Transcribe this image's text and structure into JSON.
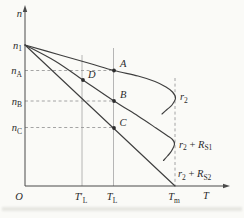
{
  "figure": {
    "background": "#fafaf7",
    "ink": "#3e3e3e",
    "guide_color": "#a3a3a3",
    "dash_color": "#9a9a9a",
    "text_color": "#2b2b2b"
  },
  "chart_data": {
    "type": "line",
    "title": "",
    "xlabel": "T",
    "ylabel": "n",
    "grid": false,
    "legend_position": "right-of-curves",
    "description_units": "pixel coordinates of 244x218 canvas; origin O at (25,186), y-axis up",
    "x_tick_labels": [
      "O",
      "T′L",
      "TL",
      "Tm"
    ],
    "y_tick_labels": [
      "n1",
      "nA",
      "nB",
      "nC"
    ],
    "series": [
      {
        "name": "natural-characteristic",
        "label": "r2",
        "points": [
          [
            25,
            45
          ],
          [
            60,
            55
          ],
          [
            90,
            63.5
          ],
          [
            114,
            70.5
          ],
          [
            138,
            76
          ],
          [
            155,
            81.5
          ],
          [
            166,
            87
          ],
          [
            172.5,
            92
          ],
          [
            175.5,
            98
          ],
          [
            172,
            105
          ],
          [
            167,
            109.5
          ],
          [
            162,
            114
          ]
        ]
      },
      {
        "name": "characteristic-with-RS1",
        "label": "r2 + RS1",
        "points": [
          [
            25,
            45
          ],
          [
            55,
            61
          ],
          [
            83,
            80
          ],
          [
            114,
            101
          ],
          [
            138,
            116
          ],
          [
            156,
            128
          ],
          [
            167,
            135.5
          ],
          [
            172.5,
            139.5
          ],
          [
            174.5,
            144
          ],
          [
            171.5,
            151
          ],
          [
            167.5,
            156
          ],
          [
            163.5,
            160.5
          ]
        ]
      },
      {
        "name": "characteristic-with-RS2",
        "label": "r2 + RS2",
        "points": [
          [
            25,
            45
          ],
          [
            175,
            186
          ]
        ]
      }
    ],
    "marked_points": [
      {
        "label": "A",
        "x": 114,
        "y": 70.5,
        "on": "natural-characteristic at TL"
      },
      {
        "label": "D",
        "x": 83,
        "y": 80,
        "on": "characteristic-with-RS1 at T′L"
      },
      {
        "label": "B",
        "x": 114,
        "y": 101,
        "on": "characteristic-with-RS1 at TL"
      },
      {
        "label": "C",
        "x": 114,
        "y": 128,
        "on": "characteristic-with-RS2 at TL"
      }
    ],
    "axes": {
      "y_axis": {
        "x": 25,
        "y_bottom": 186,
        "y_top": 9,
        "arrow_tip_y": 5
      },
      "x_axis": {
        "y": 186,
        "x_left": 25,
        "x_right": 225,
        "arrow_tip_x": 230
      }
    },
    "guide_lines": {
      "vertical_solid": [
        {
          "name": "TL-prime-guide",
          "x": 82,
          "y1": 55,
          "y2": 186
        },
        {
          "name": "TL-guide",
          "x": 113.5,
          "y1": 48,
          "y2": 186
        }
      ],
      "vertical_dashed": [
        {
          "name": "Tm-guide",
          "x": 175,
          "y1": 78,
          "y2": 186
        }
      ],
      "horizontal_dashed": [
        {
          "name": "nA-guide",
          "y": 70.5,
          "x1": 25,
          "x2": 114
        },
        {
          "name": "nB-guide",
          "y": 101,
          "x1": 25,
          "x2": 114
        },
        {
          "name": "nC-guide",
          "y": 127.5,
          "x1": 25,
          "x2": 114
        }
      ]
    },
    "labels": [
      {
        "name": "y-axis-label",
        "x": 22,
        "y": 17,
        "anchor": "end",
        "parts": [
          {
            "t": "n",
            "it": true
          }
        ]
      },
      {
        "name": "n1-tick-label",
        "x": 22,
        "y": 48.5,
        "anchor": "end",
        "parts": [
          {
            "t": "n",
            "it": true
          },
          {
            "t": "1",
            "sub": true
          }
        ]
      },
      {
        "name": "nA-tick-label",
        "x": 22,
        "y": 74,
        "anchor": "end",
        "parts": [
          {
            "t": "n",
            "it": true
          },
          {
            "t": "A",
            "sub": true
          }
        ]
      },
      {
        "name": "nB-tick-label",
        "x": 22,
        "y": 104.5,
        "anchor": "end",
        "parts": [
          {
            "t": "n",
            "it": true
          },
          {
            "t": "B",
            "sub": true
          }
        ]
      },
      {
        "name": "nC-tick-label",
        "x": 22,
        "y": 131,
        "anchor": "end",
        "parts": [
          {
            "t": "n",
            "it": true
          },
          {
            "t": "C",
            "sub": true
          }
        ]
      },
      {
        "name": "origin-label",
        "x": 19,
        "y": 200,
        "anchor": "middle",
        "parts": [
          {
            "t": "O",
            "it": true
          }
        ]
      },
      {
        "name": "TL-prime-tick-label",
        "x": 81,
        "y": 200,
        "anchor": "middle",
        "parts": [
          {
            "t": "T",
            "it": true
          },
          {
            "t": "′"
          },
          {
            "t": "L",
            "sub": true
          }
        ]
      },
      {
        "name": "TL-tick-label",
        "x": 112,
        "y": 200,
        "anchor": "middle",
        "parts": [
          {
            "t": "T",
            "it": true
          },
          {
            "t": "L",
            "sub": true
          }
        ]
      },
      {
        "name": "Tm-tick-label",
        "x": 174,
        "y": 200,
        "anchor": "middle",
        "parts": [
          {
            "t": "T",
            "it": true
          },
          {
            "t": "m",
            "sub": true
          }
        ]
      },
      {
        "name": "x-axis-label",
        "x": 206,
        "y": 199,
        "anchor": "middle",
        "parts": [
          {
            "t": "T",
            "it": true
          }
        ]
      },
      {
        "name": "point-A-label",
        "x": 120,
        "y": 67,
        "anchor": "start",
        "parts": [
          {
            "t": "A",
            "it": true
          }
        ]
      },
      {
        "name": "point-D-label",
        "x": 88,
        "y": 78,
        "anchor": "start",
        "parts": [
          {
            "t": "D",
            "it": true
          }
        ]
      },
      {
        "name": "point-B-label",
        "x": 120,
        "y": 97.5,
        "anchor": "start",
        "parts": [
          {
            "t": "B",
            "it": true
          }
        ]
      },
      {
        "name": "point-C-label",
        "x": 119.5,
        "y": 125.5,
        "anchor": "start",
        "parts": [
          {
            "t": "C",
            "it": true
          }
        ]
      },
      {
        "name": "curve-r2-label",
        "x": 180,
        "y": 100,
        "anchor": "start",
        "parts": [
          {
            "t": "r",
            "it": true
          },
          {
            "t": "2",
            "sub": true
          }
        ]
      },
      {
        "name": "curve-r2-RS1-label",
        "x": 179,
        "y": 147.5,
        "anchor": "start",
        "parts": [
          {
            "t": "r",
            "it": true
          },
          {
            "t": "2",
            "sub": true
          },
          {
            "t": " + "
          },
          {
            "t": "R",
            "it": true
          },
          {
            "t": "S1",
            "sub": true
          }
        ]
      },
      {
        "name": "curve-r2-RS2-label",
        "x": 178,
        "y": 177,
        "anchor": "start",
        "parts": [
          {
            "t": "r",
            "it": true
          },
          {
            "t": "2",
            "sub": true
          },
          {
            "t": " + "
          },
          {
            "t": "R",
            "it": true
          },
          {
            "t": "S2",
            "sub": true
          }
        ]
      }
    ],
    "artifact": {
      "name": "scan-smudge",
      "x": 2,
      "y": 207,
      "w": 240,
      "h": 4
    }
  }
}
